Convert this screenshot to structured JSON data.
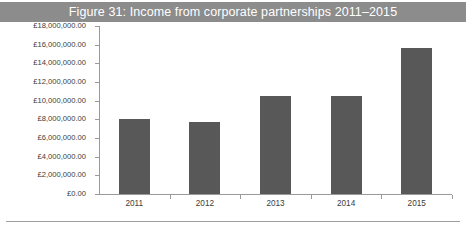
{
  "figure": {
    "title": "Figure 31: Income from corporate partnerships 2011–2015",
    "title_band_color": "#8c8c8c",
    "title_text_color": "#ffffff",
    "background_color": "#ffffff",
    "axis_color": "#9a9a9a",
    "rule_color": "#9e9e9e"
  },
  "chart_data": {
    "type": "bar",
    "title": "Figure 31: Income from corporate partnerships 2011–2015",
    "xlabel": "",
    "ylabel": "",
    "categories": [
      "2011",
      "2012",
      "2013",
      "2014",
      "2015"
    ],
    "values": [
      8000000,
      7700000,
      10500000,
      10500000,
      15600000
    ],
    "series": [
      {
        "name": "Income from corporate partnerships",
        "values": [
          8000000,
          7700000,
          10500000,
          10500000,
          15600000
        ]
      }
    ],
    "ylim": [
      0,
      18000000
    ],
    "ytick_values": [
      0,
      2000000,
      4000000,
      6000000,
      8000000,
      10000000,
      12000000,
      14000000,
      16000000,
      18000000
    ],
    "ytick_labels": [
      "£0.00",
      "£2,000,000.00",
      "£4,000,000.00",
      "£6,000,000.00",
      "£8,000,000.00",
      "£10,000,000.00",
      "£12,000,000.00",
      "£14,000,000.00",
      "£16,000,000.00",
      "£18,000,000.00"
    ],
    "xtick_labels": [
      "2011",
      "2012",
      "2013",
      "2014",
      "2015"
    ],
    "bar_color": "#585858",
    "grid": false,
    "legend": false,
    "legend_position": "none",
    "currency": "GBP"
  }
}
